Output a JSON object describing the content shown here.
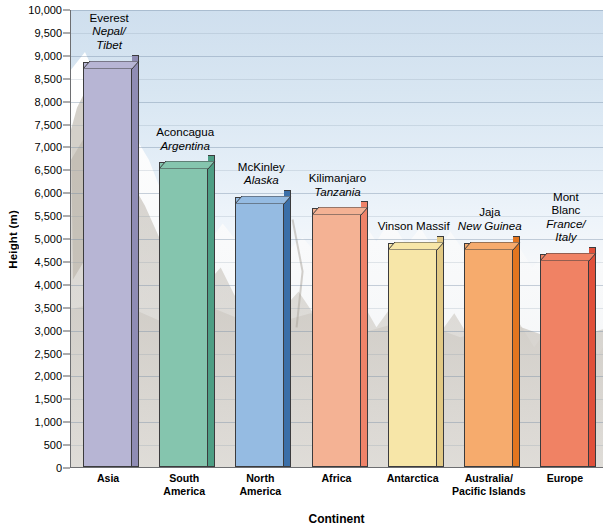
{
  "chart_data": {
    "type": "bar",
    "title": "",
    "xlabel": "Continent",
    "ylabel": "Height (m)",
    "ylim": [
      0,
      10000
    ],
    "ytick_step": 500,
    "grid": true,
    "legend": "none",
    "categories": [
      "Asia",
      "South America",
      "North America",
      "Africa",
      "Antarctica",
      "Australia/ Pacific Islands",
      "Europe"
    ],
    "values": [
      8850,
      6650,
      5900,
      5650,
      4900,
      4900,
      4650
    ],
    "ytick_labels": [
      "10,000",
      "9,500",
      "9,000",
      "8,500",
      "8,000",
      "7,500",
      "7,000",
      "6,500",
      "6,000",
      "5,500",
      "5,000",
      "4,500",
      "4,000",
      "3,500",
      "3,000",
      "2,500",
      "2,000",
      "1,500",
      "1,000",
      "500",
      "0"
    ],
    "ytick_values": [
      10000,
      9500,
      9000,
      8500,
      8000,
      7500,
      7000,
      6500,
      6000,
      5500,
      5000,
      4500,
      4000,
      3500,
      3000,
      2500,
      2000,
      1500,
      1000,
      500,
      0
    ],
    "bars": [
      {
        "continent": "Asia",
        "continent_lines": [
          "Asia"
        ],
        "peak": "Everest",
        "location_lines": [
          "Nepal/",
          "Tibet"
        ],
        "value": 8850,
        "face_color": "#b7b5d4",
        "side_color": "#8f8cb4"
      },
      {
        "continent": "South America",
        "continent_lines": [
          "South",
          "America"
        ],
        "peak": "Aconcagua",
        "location_lines": [
          "Argentina"
        ],
        "value": 6650,
        "face_color": "#85c5ae",
        "side_color": "#4d9e84"
      },
      {
        "continent": "North America",
        "continent_lines": [
          "North",
          "America"
        ],
        "peak": "McKinley",
        "location_lines": [
          "Alaska"
        ],
        "value": 5900,
        "face_color": "#95bbe2",
        "side_color": "#3b6fa8"
      },
      {
        "continent": "Africa",
        "continent_lines": [
          "Africa"
        ],
        "peak": "Kilimanjaro",
        "location_lines": [
          "Tanzania"
        ],
        "value": 5650,
        "face_color": "#f4b294",
        "side_color": "#ef8369"
      },
      {
        "continent": "Antarctica",
        "continent_lines": [
          "Antarctica"
        ],
        "peak": "Vinson Massif",
        "location_lines": [],
        "value": 4900,
        "face_color": "#f7e6a8",
        "side_color": "#e2c984"
      },
      {
        "continent": "Australia/ Pacific Islands",
        "continent_lines": [
          "Australia/",
          "Pacific Islands"
        ],
        "peak": "Jaja",
        "location_lines": [
          "New Guinea"
        ],
        "value": 4900,
        "face_color": "#f6ab6d",
        "side_color": "#e2751f"
      },
      {
        "continent": "Europe",
        "continent_lines": [
          "Europe"
        ],
        "peak": "Mont Blanc",
        "peak_lines": [
          "Mont",
          "Blanc"
        ],
        "location_lines": [
          "France/",
          "Italy"
        ],
        "value": 4650,
        "face_color": "#f08264",
        "side_color": "#e0503a"
      }
    ]
  },
  "colors": {
    "axis": "#6d6e71",
    "grid": "#8ea6bd",
    "text": "#000000",
    "sky_top": "#cfdfee",
    "sky_bottom": "#dedfe0"
  },
  "axis": {
    "y_title": "Height (m)",
    "x_title": "Continent"
  }
}
